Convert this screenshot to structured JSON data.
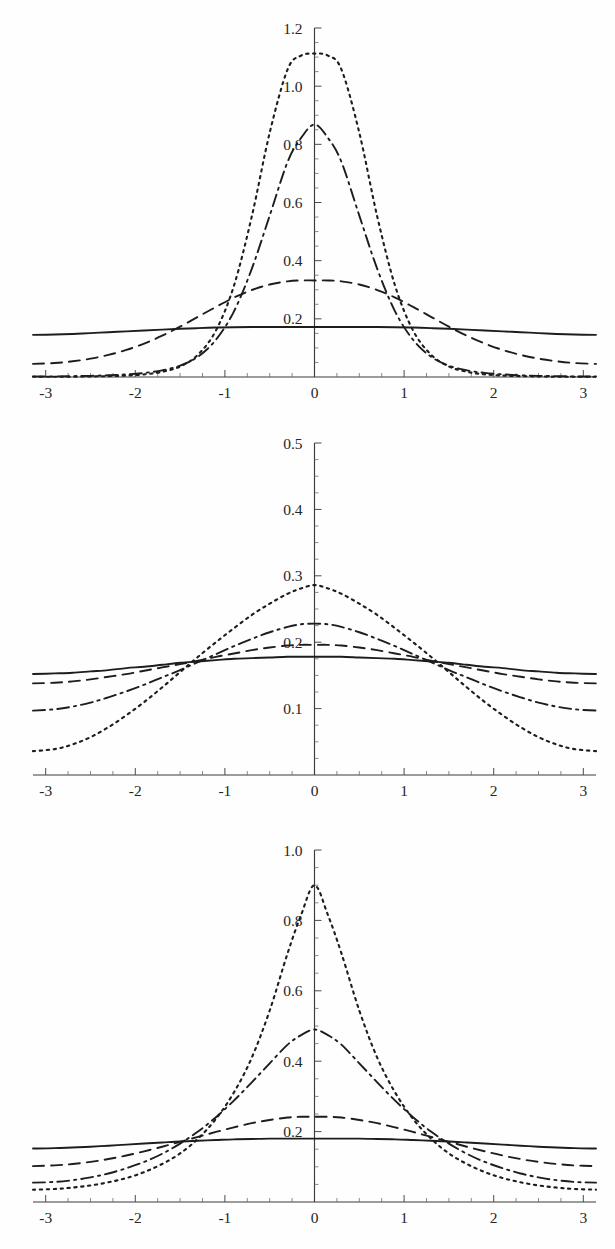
{
  "figure": {
    "title": "",
    "background": "#ffffff",
    "ink_color": "#1d1d1d",
    "panel_count": 3
  },
  "chart_data": [
    {
      "type": "line",
      "panel_index": 1,
      "title": "",
      "xlabel": "",
      "ylabel": "",
      "xlim": [
        -3.1416,
        3.1416
      ],
      "ylim": [
        0,
        1.2
      ],
      "grid": false,
      "legend": "none",
      "xticks": [
        -3,
        -2,
        -1,
        0,
        1,
        2,
        3
      ],
      "xticklabels": [
        "-3",
        "-2",
        "-1",
        "0",
        "1",
        "2",
        "3"
      ],
      "yticks": [
        0.2,
        0.4,
        0.6,
        0.8,
        1.0,
        1.2
      ],
      "yticklabels": [
        "0.2",
        "0.4",
        "0.6",
        "0.8",
        "1.0",
        "1.2"
      ],
      "minor_tick_count_between": 3,
      "x": [
        -3.1416,
        -2.9,
        -2.7,
        -2.5,
        -2.3,
        -2.1,
        -1.9,
        -1.7,
        -1.5,
        -1.3,
        -1.1,
        -0.9,
        -0.7,
        -0.5,
        -0.3,
        -0.15,
        0,
        0.15,
        0.3,
        0.5,
        0.7,
        0.9,
        1.1,
        1.3,
        1.5,
        1.7,
        1.9,
        2.1,
        2.3,
        2.5,
        2.7,
        2.9,
        3.1416
      ],
      "series": [
        {
          "name": "solid",
          "style": "solid",
          "peak": 0.172,
          "edge": 0.145,
          "values": [
            0.145,
            0.146,
            0.148,
            0.151,
            0.154,
            0.157,
            0.16,
            0.163,
            0.166,
            0.168,
            0.17,
            0.171,
            0.172,
            0.172,
            0.172,
            0.172,
            0.172,
            0.172,
            0.172,
            0.172,
            0.172,
            0.171,
            0.17,
            0.168,
            0.166,
            0.163,
            0.16,
            0.157,
            0.154,
            0.151,
            0.148,
            0.146,
            0.145
          ]
        },
        {
          "name": "long-dash",
          "style": "dash",
          "peak": 0.332,
          "edge": 0.045,
          "values": [
            0.045,
            0.048,
            0.054,
            0.063,
            0.076,
            0.093,
            0.115,
            0.142,
            0.173,
            0.207,
            0.241,
            0.273,
            0.299,
            0.318,
            0.329,
            0.332,
            0.332,
            0.332,
            0.329,
            0.318,
            0.299,
            0.273,
            0.241,
            0.207,
            0.173,
            0.142,
            0.115,
            0.093,
            0.076,
            0.063,
            0.054,
            0.048,
            0.045
          ]
        },
        {
          "name": "dash-dot",
          "style": "dashdot",
          "peak": 0.87,
          "edge": 0.002,
          "values": [
            0.002,
            0.002,
            0.003,
            0.004,
            0.006,
            0.009,
            0.014,
            0.023,
            0.039,
            0.07,
            0.128,
            0.225,
            0.372,
            0.555,
            0.74,
            0.822,
            0.868,
            0.822,
            0.74,
            0.555,
            0.372,
            0.225,
            0.128,
            0.07,
            0.039,
            0.023,
            0.014,
            0.009,
            0.006,
            0.004,
            0.003,
            0.002,
            0.002
          ]
        },
        {
          "name": "dotted",
          "style": "dot",
          "peak": 1.11,
          "edge": 0.001,
          "values": [
            0.001,
            0.001,
            0.001,
            0.002,
            0.003,
            0.005,
            0.009,
            0.018,
            0.036,
            0.077,
            0.16,
            0.313,
            0.552,
            0.84,
            1.058,
            1.105,
            1.112,
            1.105,
            1.058,
            0.84,
            0.552,
            0.313,
            0.16,
            0.077,
            0.036,
            0.018,
            0.009,
            0.005,
            0.003,
            0.002,
            0.001,
            0.001,
            0.001
          ]
        }
      ]
    },
    {
      "type": "line",
      "panel_index": 2,
      "title": "",
      "xlabel": "",
      "ylabel": "",
      "xlim": [
        -3.1416,
        3.1416
      ],
      "ylim": [
        0,
        0.5
      ],
      "grid": false,
      "legend": "none",
      "xticks": [
        -3,
        -2,
        -1,
        0,
        1,
        2,
        3
      ],
      "xticklabels": [
        "-3",
        "-2",
        "-1",
        "0",
        "1",
        "2",
        "3"
      ],
      "yticks": [
        0.1,
        0.2,
        0.3,
        0.4,
        0.5
      ],
      "yticklabels": [
        "0.1",
        "0.2",
        "0.3",
        "0.4",
        "0.5"
      ],
      "minor_tick_count_between": 3,
      "x": [
        -3.1416,
        -2.9,
        -2.7,
        -2.5,
        -2.3,
        -2.1,
        -1.9,
        -1.7,
        -1.5,
        -1.3,
        -1.1,
        -0.9,
        -0.7,
        -0.5,
        -0.3,
        -0.15,
        0,
        0.15,
        0.3,
        0.5,
        0.7,
        0.9,
        1.1,
        1.3,
        1.5,
        1.7,
        1.9,
        2.1,
        2.3,
        2.5,
        2.7,
        2.9,
        3.1416
      ],
      "series": [
        {
          "name": "solid",
          "style": "solid",
          "peak": 0.178,
          "edge": 0.152,
          "values": [
            0.152,
            0.153,
            0.154,
            0.156,
            0.158,
            0.161,
            0.163,
            0.166,
            0.169,
            0.171,
            0.173,
            0.175,
            0.176,
            0.177,
            0.178,
            0.178,
            0.178,
            0.178,
            0.178,
            0.177,
            0.176,
            0.175,
            0.173,
            0.171,
            0.169,
            0.166,
            0.163,
            0.161,
            0.158,
            0.156,
            0.154,
            0.153,
            0.152
          ]
        },
        {
          "name": "dash",
          "style": "dash",
          "peak": 0.196,
          "edge": 0.138,
          "values": [
            0.138,
            0.139,
            0.141,
            0.144,
            0.148,
            0.152,
            0.157,
            0.162,
            0.167,
            0.172,
            0.178,
            0.183,
            0.188,
            0.192,
            0.195,
            0.196,
            0.196,
            0.196,
            0.195,
            0.192,
            0.188,
            0.183,
            0.178,
            0.172,
            0.167,
            0.162,
            0.157,
            0.152,
            0.148,
            0.144,
            0.141,
            0.139,
            0.138
          ]
        },
        {
          "name": "dash-dot",
          "style": "dashdot",
          "peak": 0.228,
          "edge": 0.097,
          "values": [
            0.097,
            0.099,
            0.103,
            0.109,
            0.117,
            0.126,
            0.136,
            0.147,
            0.158,
            0.17,
            0.182,
            0.194,
            0.205,
            0.215,
            0.223,
            0.227,
            0.228,
            0.227,
            0.223,
            0.215,
            0.205,
            0.194,
            0.182,
            0.17,
            0.158,
            0.147,
            0.136,
            0.126,
            0.117,
            0.109,
            0.103,
            0.099,
            0.097
          ]
        },
        {
          "name": "dotted",
          "style": "dot",
          "peak": 0.286,
          "edge": 0.036,
          "values": [
            0.036,
            0.039,
            0.046,
            0.057,
            0.072,
            0.09,
            0.11,
            0.132,
            0.155,
            0.178,
            0.2,
            0.221,
            0.241,
            0.258,
            0.273,
            0.281,
            0.286,
            0.281,
            0.273,
            0.258,
            0.241,
            0.221,
            0.2,
            0.178,
            0.155,
            0.132,
            0.11,
            0.09,
            0.072,
            0.057,
            0.046,
            0.039,
            0.036
          ]
        }
      ]
    },
    {
      "type": "line",
      "panel_index": 3,
      "title": "",
      "xlabel": "",
      "ylabel": "",
      "xlim": [
        -3.1416,
        3.1416
      ],
      "ylim": [
        0,
        1.0
      ],
      "grid": false,
      "legend": "none",
      "xticks": [
        -3,
        -2,
        -1,
        0,
        1,
        2,
        3
      ],
      "xticklabels": [
        "-3",
        "-2",
        "-1",
        "0",
        "1",
        "2",
        "3"
      ],
      "yticks": [
        0.2,
        0.4,
        0.6,
        0.8,
        1.0
      ],
      "yticklabels": [
        "0.2",
        "0.4",
        "0.6",
        "0.8",
        "1.0"
      ],
      "minor_tick_count_between": 3,
      "x": [
        -3.1416,
        -2.9,
        -2.7,
        -2.5,
        -2.3,
        -2.1,
        -1.9,
        -1.7,
        -1.5,
        -1.3,
        -1.1,
        -0.9,
        -0.7,
        -0.5,
        -0.3,
        -0.15,
        0,
        0.15,
        0.3,
        0.5,
        0.7,
        0.9,
        1.1,
        1.3,
        1.5,
        1.7,
        1.9,
        2.1,
        2.3,
        2.5,
        2.7,
        2.9,
        3.1416
      ],
      "series": [
        {
          "name": "solid",
          "style": "solid",
          "peak": 0.18,
          "edge": 0.152,
          "values": [
            0.152,
            0.153,
            0.155,
            0.157,
            0.16,
            0.163,
            0.166,
            0.169,
            0.172,
            0.174,
            0.176,
            0.178,
            0.179,
            0.18,
            0.18,
            0.18,
            0.18,
            0.18,
            0.18,
            0.18,
            0.179,
            0.178,
            0.176,
            0.174,
            0.172,
            0.169,
            0.166,
            0.163,
            0.16,
            0.157,
            0.155,
            0.153,
            0.152
          ]
        },
        {
          "name": "dash",
          "style": "dash",
          "peak": 0.242,
          "edge": 0.102,
          "values": [
            0.102,
            0.104,
            0.108,
            0.114,
            0.122,
            0.132,
            0.144,
            0.157,
            0.171,
            0.185,
            0.199,
            0.212,
            0.224,
            0.233,
            0.24,
            0.242,
            0.242,
            0.242,
            0.24,
            0.233,
            0.224,
            0.212,
            0.199,
            0.185,
            0.171,
            0.157,
            0.144,
            0.132,
            0.122,
            0.114,
            0.108,
            0.104,
            0.102
          ]
        },
        {
          "name": "dash-dot",
          "style": "dashdot",
          "peak": 0.49,
          "edge": 0.055,
          "values": [
            0.055,
            0.057,
            0.062,
            0.07,
            0.081,
            0.096,
            0.114,
            0.137,
            0.166,
            0.2,
            0.241,
            0.288,
            0.34,
            0.394,
            0.447,
            0.474,
            0.49,
            0.474,
            0.447,
            0.394,
            0.34,
            0.288,
            0.241,
            0.2,
            0.166,
            0.137,
            0.114,
            0.096,
            0.081,
            0.07,
            0.062,
            0.057,
            0.055
          ]
        },
        {
          "name": "dotted",
          "style": "dot",
          "peak": 0.9,
          "edge": 0.035,
          "values": [
            0.035,
            0.037,
            0.041,
            0.047,
            0.056,
            0.068,
            0.085,
            0.108,
            0.138,
            0.18,
            0.236,
            0.311,
            0.41,
            0.544,
            0.707,
            0.815,
            0.9,
            0.815,
            0.707,
            0.544,
            0.41,
            0.311,
            0.236,
            0.18,
            0.138,
            0.108,
            0.085,
            0.068,
            0.056,
            0.047,
            0.041,
            0.037,
            0.035
          ]
        }
      ]
    }
  ]
}
